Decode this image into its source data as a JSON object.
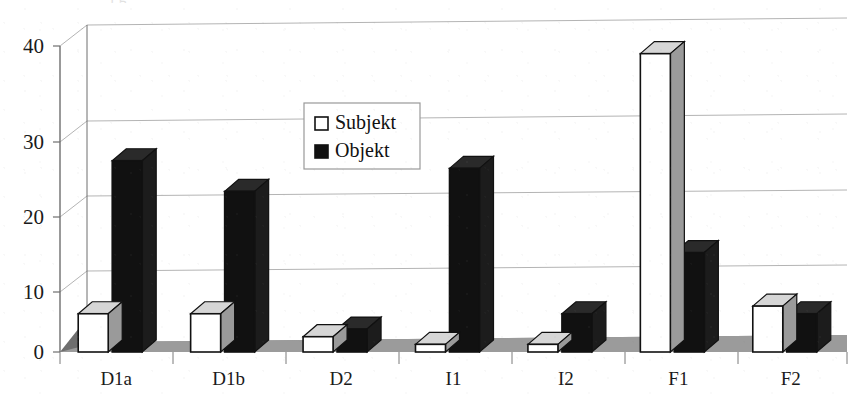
{
  "figure": {
    "title_remnant": "j                                        g",
    "background": "#ffffff"
  },
  "legend": {
    "position": "inside-upper-left-center",
    "entries": [
      {
        "label": "Subjekt",
        "swatch": "white",
        "color": "#ffffff",
        "border": "#111111"
      },
      {
        "label": "Objekt",
        "swatch": "black",
        "color": "#111111",
        "border": "#111111"
      }
    ]
  },
  "axes": {
    "y_ticks": [
      "0",
      "10",
      "20",
      "30",
      "40"
    ],
    "x_labels": [
      "D1a",
      "D1b",
      "D2",
      "I1",
      "I2",
      "F1",
      "F2"
    ]
  },
  "colors": {
    "subjekt_face": "#ffffff",
    "subjekt_side": "#9a9a9a",
    "subjekt_top": "#d6d6d6",
    "objekt_face": "#111111",
    "objekt_side": "#1c1c1c",
    "objekt_top": "#2a2a2a",
    "floor": "#8f8f8f",
    "wall": "#ffffff",
    "gridline": "#b4b4b4",
    "axis": "#6e6e6e"
  },
  "chart_data": {
    "type": "bar",
    "title": "",
    "xlabel": "",
    "ylabel": "",
    "ylim": [
      0,
      40
    ],
    "yticks": [
      0,
      10,
      20,
      30,
      40
    ],
    "grid": true,
    "style": "3d-clustered-column",
    "legend_position": "inside upper left-center",
    "categories": [
      "D1a",
      "D1b",
      "D2",
      "I1",
      "I2",
      "F1",
      "F2"
    ],
    "series": [
      {
        "name": "Subjekt",
        "values": [
          5,
          5,
          2,
          1,
          1,
          39,
          6
        ]
      },
      {
        "name": "Objekt",
        "values": [
          25,
          21,
          3,
          24,
          5,
          13,
          5
        ]
      }
    ]
  }
}
